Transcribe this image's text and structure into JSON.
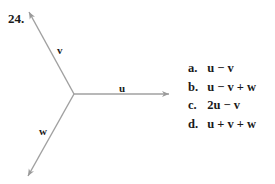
{
  "problem": {
    "number": "24."
  },
  "diagram": {
    "origin": [
      74,
      94
    ],
    "arrow_color": "#9a9a9a",
    "vectors": [
      {
        "name": "u",
        "label": "u",
        "tip": [
          169,
          94
        ],
        "label_pos": [
          119,
          94
        ]
      },
      {
        "name": "v",
        "label": "v",
        "tip": [
          29,
          12
        ],
        "label_pos": [
          58,
          55
        ]
      },
      {
        "name": "w",
        "label": "w",
        "tip": [
          28,
          176
        ],
        "label_pos": [
          40,
          135
        ]
      }
    ]
  },
  "options": [
    {
      "letter": "a.",
      "expr": "u − v"
    },
    {
      "letter": "b.",
      "expr": "u − v + w"
    },
    {
      "letter": "c.",
      "expr": "2u − v"
    },
    {
      "letter": "d.",
      "expr": "u + v + w"
    }
  ]
}
